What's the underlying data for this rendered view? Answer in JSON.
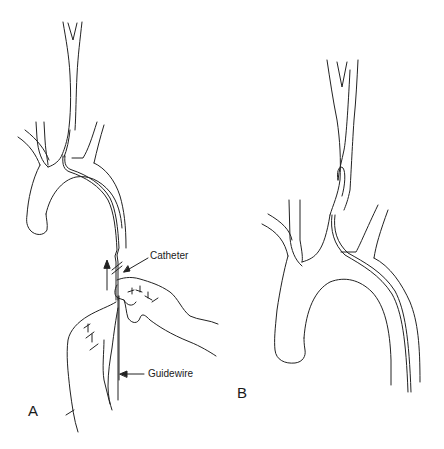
{
  "figure": {
    "panels": [
      {
        "id": "A",
        "label": "A"
      },
      {
        "id": "B",
        "label": "B"
      }
    ],
    "callouts": {
      "catheter": "Catheter",
      "guidewire": "Guidewire"
    },
    "colors": {
      "line": "#222222",
      "background": "#ffffff"
    }
  }
}
